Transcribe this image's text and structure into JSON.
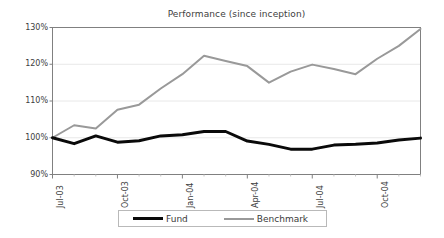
{
  "chart_data": {
    "type": "line",
    "title": "Performance (since inception)",
    "xlabel": "",
    "ylabel": "",
    "ylim": [
      90,
      130
    ],
    "yticks": [
      "90%",
      "100%",
      "110%",
      "120%",
      "130%"
    ],
    "ytick_values": [
      90,
      100,
      110,
      120,
      130
    ],
    "grid": true,
    "legend_position": "bottom",
    "x": [
      "Jul-03",
      "Aug-03",
      "Sep-03",
      "Oct-03",
      "Nov-03",
      "Dec-03",
      "Jan-04",
      "Feb-04",
      "Mar-04",
      "Apr-04",
      "May-04",
      "Jun-04",
      "Jul-04",
      "Aug-04",
      "Sep-04",
      "Oct-04",
      "Nov-04",
      "Dec-04"
    ],
    "xtick_labels": [
      "Jul-03",
      "Oct-03",
      "Jan-04",
      "Apr-04",
      "Jul-04",
      "Oct-04"
    ],
    "xtick_indices": [
      0,
      3,
      6,
      9,
      12,
      15
    ],
    "series": [
      {
        "name": "Fund",
        "color": "#0a0a0a",
        "width": 3,
        "values": [
          100.0,
          98.4,
          100.5,
          98.8,
          99.2,
          100.5,
          100.8,
          101.7,
          101.7,
          99.1,
          98.2,
          96.9,
          96.9,
          98.0,
          98.2,
          98.6,
          99.4,
          99.9
        ]
      },
      {
        "name": "Benchmark",
        "color": "#999999",
        "width": 2,
        "values": [
          100.0,
          103.4,
          102.5,
          107.6,
          109.0,
          113.4,
          117.3,
          122.3,
          120.9,
          119.5,
          115.0,
          118.0,
          119.9,
          118.7,
          117.3,
          121.5,
          125.0,
          129.6
        ]
      }
    ]
  },
  "legend": {
    "entries": [
      {
        "label": "Fund"
      },
      {
        "label": "Benchmark"
      }
    ]
  },
  "axes": {
    "border_color": "#808080",
    "grid_color": "#e8e8e8"
  }
}
